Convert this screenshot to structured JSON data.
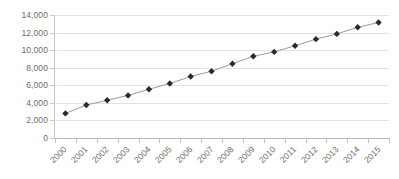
{
  "chart_data": {
    "type": "line",
    "title": "",
    "subtitle": "",
    "xlabel": "",
    "ylabel": "",
    "categories": [
      "2000",
      "2001",
      "2002",
      "2003",
      "2004",
      "2005",
      "2006",
      "2007",
      "2008",
      "2009",
      "2010",
      "2011",
      "2012",
      "2013",
      "2014",
      "2015"
    ],
    "values": [
      2800,
      3750,
      4300,
      4850,
      5550,
      6200,
      7000,
      7600,
      8450,
      9300,
      9800,
      10500,
      11250,
      11850,
      12600,
      13150
    ],
    "series": [
      {
        "name": "",
        "values": [
          2800,
          3750,
          4300,
          4850,
          5550,
          6200,
          7000,
          7600,
          8450,
          9300,
          9800,
          10500,
          11250,
          11850,
          12600,
          13150
        ]
      }
    ],
    "ylim": [
      0,
      14000
    ],
    "ytick_labels": [
      "0",
      "2,000",
      "4,000",
      "6,000",
      "8,000",
      "10,000",
      "12,000",
      "14,000"
    ],
    "ytick_values": [
      0,
      2000,
      4000,
      6000,
      8000,
      10000,
      12000,
      14000
    ],
    "xtick_labels": [
      "2000",
      "2001",
      "2002",
      "2003",
      "2004",
      "2005",
      "2006",
      "2007",
      "2008",
      "2009",
      "2010",
      "2011",
      "2012",
      "2013",
      "2014",
      "2015"
    ],
    "grid": true,
    "grid_axis": "y",
    "legend": false,
    "legend_position": "none",
    "marker": "diamond",
    "xtick_label_rotation": -45,
    "colors": {
      "line": "#9c9c9c",
      "marker": "#2b2b2b",
      "gridline": "#e2e2e2",
      "axis": "#c9c9c9",
      "tick_label": "#6d6d6d",
      "background": "#ffffff"
    }
  }
}
